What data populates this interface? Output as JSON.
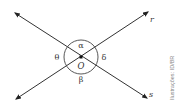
{
  "diagram": {
    "center_label": "O",
    "lines": [
      {
        "name": "r",
        "label": "r"
      },
      {
        "name": "s",
        "label": "s"
      }
    ],
    "angles": {
      "top": "α",
      "right": "δ",
      "bottom": "β",
      "left": "θ"
    },
    "credit": "Ilustrações: ID/BR",
    "colors": {
      "line": "#333333",
      "arc": "#444444",
      "text": "#333333",
      "credit": "#888888"
    }
  }
}
